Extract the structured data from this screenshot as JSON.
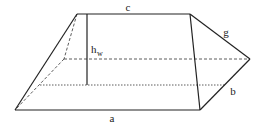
{
  "diagram": {
    "type": "geometric-solid",
    "labels": {
      "top_edge": "c",
      "bottom_edge": "a",
      "slant_edge": "g",
      "side_edge": "b",
      "height": "h",
      "height_subscript": "w"
    },
    "colors": {
      "stroke": "#222222",
      "background": "#ffffff"
    }
  }
}
